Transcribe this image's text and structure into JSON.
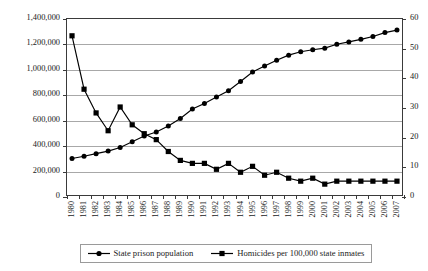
{
  "chart_data": {
    "type": "line",
    "title": "",
    "xlabel": "",
    "ylabel": "",
    "grid": true,
    "legend_position": "bottom",
    "categories": [
      "1980",
      "1981",
      "1982",
      "1983",
      "1984",
      "1985",
      "1986",
      "1987",
      "1988",
      "1989",
      "1990",
      "1991",
      "1992",
      "1993",
      "1994",
      "1995",
      "1996",
      "1997",
      "1998",
      "1999",
      "2000",
      "2001",
      "2002",
      "2003",
      "2004",
      "2005",
      "2006",
      "2007"
    ],
    "axes": {
      "left": {
        "label": "",
        "min": 0,
        "max": 1400000,
        "step": 200000,
        "ticks": [
          "0",
          "200,000",
          "400,000",
          "600,000",
          "800,000",
          "1,000,000",
          "1,200,000",
          "1,400,000"
        ]
      },
      "right": {
        "label": "",
        "min": 0,
        "max": 60,
        "step": 10,
        "ticks": [
          "0",
          "10",
          "20",
          "30",
          "40",
          "50",
          "60"
        ]
      }
    },
    "series": [
      {
        "name": "State prison population",
        "axis": "left",
        "marker": "circle",
        "values": [
          295000,
          313000,
          333000,
          353000,
          382000,
          426000,
          472000,
          503000,
          550000,
          610000,
          684000,
          728000,
          778000,
          828000,
          900000,
          975000,
          1022000,
          1068000,
          1108000,
          1135000,
          1150000,
          1163000,
          1194000,
          1212000,
          1232000,
          1255000,
          1285000,
          1305000
        ]
      },
      {
        "name": "Homicides per 100,000 state inmates",
        "axis": "right",
        "marker": "square",
        "values": [
          54,
          36,
          28,
          22,
          30,
          24,
          21,
          19,
          15,
          12,
          11,
          11,
          9,
          11,
          8,
          10,
          7,
          8,
          6,
          5,
          6,
          4,
          5,
          5,
          5,
          5,
          5,
          5
        ]
      }
    ]
  },
  "legend": {
    "items": [
      {
        "label": "State prison population",
        "marker": "circle"
      },
      {
        "label": "Homicides per 100,000 state inmates",
        "marker": "square"
      }
    ]
  }
}
